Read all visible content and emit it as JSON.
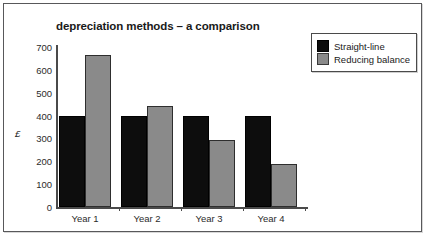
{
  "chart_data": {
    "type": "bar",
    "title": "depreciation methods – a comparison",
    "xlabel": "",
    "ylabel": "£",
    "categories": [
      "Year 1",
      "Year 2",
      "Year 3",
      "Year 4"
    ],
    "series": [
      {
        "name": "Straight-line",
        "color": "#0d0d0d",
        "values": [
          400,
          400,
          400,
          400
        ]
      },
      {
        "name": "Reducing balance",
        "color": "#8a8a8a",
        "values": [
          665,
          443,
          295,
          190
        ]
      }
    ],
    "ylim": [
      0,
      700
    ],
    "ytick_step": 100,
    "yticks": [
      "0",
      "100",
      "200",
      "300",
      "400",
      "500",
      "600",
      "700"
    ],
    "grid": false,
    "legend_position": "top-right"
  },
  "legend": {
    "entries": [
      {
        "label": "Straight-line"
      },
      {
        "label": "Reducing balance"
      }
    ]
  }
}
